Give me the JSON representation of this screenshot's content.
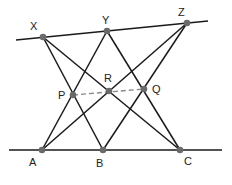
{
  "diagram": {
    "type": "geometry",
    "points": [
      {
        "id": "X",
        "label": "X",
        "x": 43,
        "y": 37,
        "lx": 30,
        "ly": 30
      },
      {
        "id": "Y",
        "label": "Y",
        "x": 107,
        "y": 31,
        "lx": 102,
        "ly": 24
      },
      {
        "id": "Z",
        "label": "Z",
        "x": 187,
        "y": 23,
        "lx": 178,
        "ly": 16
      },
      {
        "id": "P",
        "label": "P",
        "x": 73,
        "y": 95,
        "lx": 58,
        "ly": 99
      },
      {
        "id": "R",
        "label": "R",
        "x": 109,
        "y": 91,
        "lx": 104,
        "ly": 82
      },
      {
        "id": "Q",
        "label": "Q",
        "x": 144,
        "y": 89,
        "lx": 152,
        "ly": 93
      },
      {
        "id": "A",
        "label": "A",
        "x": 42,
        "y": 150,
        "lx": 29,
        "ly": 166
      },
      {
        "id": "B",
        "label": "B",
        "x": 103,
        "y": 150,
        "lx": 96,
        "ly": 167
      },
      {
        "id": "C",
        "label": "C",
        "x": 180,
        "y": 150,
        "lx": 184,
        "ly": 165
      }
    ],
    "lines": [
      {
        "name": "upper-line",
        "x1": 16,
        "y1": 40,
        "x2": 208,
        "y2": 21,
        "dashed": false
      },
      {
        "name": "lower-line",
        "x1": 9,
        "y1": 150,
        "x2": 222,
        "y2": 150,
        "dashed": false
      },
      {
        "name": "segment-XB",
        "x1": 43,
        "y1": 37,
        "x2": 103,
        "y2": 150,
        "dashed": false
      },
      {
        "name": "segment-XC",
        "x1": 43,
        "y1": 37,
        "x2": 180,
        "y2": 150,
        "dashed": false
      },
      {
        "name": "segment-YA",
        "x1": 107,
        "y1": 31,
        "x2": 42,
        "y2": 150,
        "dashed": false
      },
      {
        "name": "segment-YC",
        "x1": 107,
        "y1": 31,
        "x2": 180,
        "y2": 150,
        "dashed": false
      },
      {
        "name": "segment-ZA",
        "x1": 187,
        "y1": 23,
        "x2": 42,
        "y2": 150,
        "dashed": false
      },
      {
        "name": "segment-ZB",
        "x1": 187,
        "y1": 23,
        "x2": 103,
        "y2": 150,
        "dashed": false
      },
      {
        "name": "pappus-line-PQ",
        "x1": 73,
        "y1": 95,
        "x2": 144,
        "y2": 89,
        "dashed": true
      }
    ],
    "colors": {
      "line": "#1a1a1a",
      "dashed": "#8a8a8a",
      "point": "#6a6a6a",
      "label": "#222222"
    }
  }
}
